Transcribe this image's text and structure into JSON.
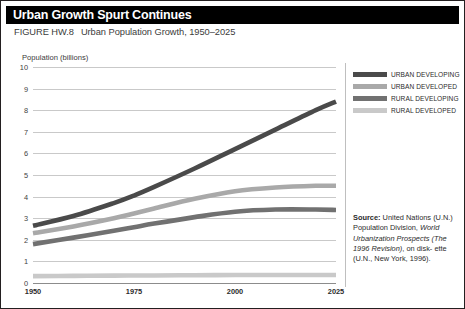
{
  "header": {
    "title": "Urban Growth Spurt Continues"
  },
  "caption": {
    "figure_number": "FIGURE HW.8",
    "text": "Urban Population Growth, 1950–2025"
  },
  "legend": {
    "position": "top-right",
    "entries": [
      {
        "label": "URBAN DEVELOPING",
        "color": "#4a4a4a"
      },
      {
        "label": "URBAN DEVELOPED",
        "color": "#a9a9a9"
      },
      {
        "label": "RURAL DEVELOPING",
        "color": "#717171"
      },
      {
        "label": "RURAL DEVELOPED",
        "color": "#c9c9c9"
      }
    ]
  },
  "source_note": {
    "label": "Source:",
    "line1": " United Nations",
    "line2": "(U.N.) Population Division,",
    "line3_italic": "World Urbanization Prospects",
    "line4_italic": "(The 1996 Revision)",
    "line4_rest": ", on disk-",
    "line5": "ette (U.N., New York, 1996)."
  },
  "chart_data": {
    "type": "line",
    "title": "Urban Population Growth, 1950–2025",
    "xlabel": "",
    "ylabel": "Population (billions)",
    "xlim": [
      1950,
      2025
    ],
    "ylim": [
      0,
      10
    ],
    "yticks": [
      0,
      1,
      2,
      3,
      4,
      5,
      6,
      7,
      8,
      9,
      10
    ],
    "xticks": [
      1950,
      1975,
      2000,
      2025
    ],
    "xtick_labels": [
      "1950",
      "1975",
      "2000",
      "2025"
    ],
    "ytick_labels": [
      "0",
      "1",
      "2",
      "3",
      "4",
      "5",
      "6",
      "7",
      "8",
      "9",
      "10"
    ],
    "grid": true,
    "x": [
      1950,
      1960,
      1970,
      1975,
      1980,
      1990,
      2000,
      2010,
      2020,
      2025
    ],
    "series": [
      {
        "name": "URBAN DEVELOPING",
        "color": "#4a4a4a",
        "values": [
          2.65,
          3.1,
          3.7,
          4.05,
          4.45,
          5.3,
          6.2,
          7.1,
          8.0,
          8.4
        ]
      },
      {
        "name": "URBAN DEVELOPED",
        "color": "#a9a9a9",
        "values": [
          2.3,
          2.62,
          3.0,
          3.22,
          3.45,
          3.9,
          4.25,
          4.42,
          4.5,
          4.5
        ]
      },
      {
        "name": "RURAL DEVELOPING",
        "color": "#717171",
        "values": [
          1.8,
          2.1,
          2.42,
          2.58,
          2.75,
          3.05,
          3.3,
          3.4,
          3.4,
          3.38
        ]
      },
      {
        "name": "RURAL DEVELOPED",
        "color": "#c9c9c9",
        "values": [
          0.32,
          0.33,
          0.34,
          0.35,
          0.35,
          0.36,
          0.37,
          0.37,
          0.37,
          0.37
        ]
      }
    ]
  }
}
